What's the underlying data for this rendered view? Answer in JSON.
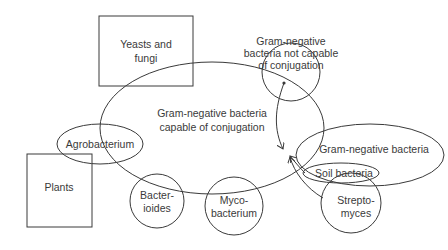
{
  "diagram": {
    "colors": {
      "stroke": "#3a3a3a",
      "text": "#3a3a3a",
      "background": "#ffffff"
    },
    "nodes": {
      "yeasts": {
        "shape": "rectangle",
        "line1": "Yeasts and",
        "line2": "fungi"
      },
      "plants": {
        "shape": "rectangle",
        "label": "Plants"
      },
      "capable": {
        "shape": "ellipse",
        "line1": "Gram-negative bacteria",
        "line2": "capable of conjugation"
      },
      "not_capable": {
        "shape": "circle",
        "line1": "Gram-negative",
        "line2": "bacteria not capable",
        "line3": "of conjugation"
      },
      "agrobacterium": {
        "shape": "ellipse",
        "label": "Agrobacterium"
      },
      "gram_negative": {
        "shape": "ellipse",
        "label": "Gram-negative bacteria"
      },
      "soil": {
        "shape": "ellipse",
        "label": "Soil bacteria"
      },
      "bacteroides": {
        "shape": "circle",
        "line1": "Bacter-",
        "line2": "ioides"
      },
      "mycobacterium": {
        "shape": "circle",
        "line1": "Myco-",
        "line2": "bacterium"
      },
      "streptomyces": {
        "shape": "circle",
        "line1": "Strepto-",
        "line2": "myces"
      }
    },
    "edges": [
      {
        "from": "not_capable",
        "to": "gram_negative",
        "type": "arrow"
      },
      {
        "from": "soil",
        "to": "gram_negative",
        "type": "arrow"
      },
      {
        "from": "streptomyces",
        "to": "gram_negative",
        "type": "arrow"
      }
    ]
  }
}
